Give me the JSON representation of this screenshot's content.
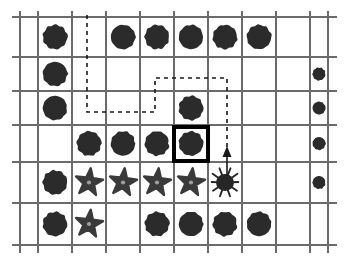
{
  "scene": {
    "title": "Grid world with obstacles, goal cell and agent path",
    "canvas": {
      "width": 345,
      "height": 261
    },
    "background_color": "#ffffff"
  },
  "grid": {
    "columns": 9,
    "rows": 6,
    "x_lines": [
      20,
      38,
      72,
      106,
      140,
      174,
      208,
      242,
      276,
      310,
      328
    ],
    "y_lines": [
      17,
      57,
      91,
      125,
      162,
      203,
      245
    ],
    "line_color": "#6b6b6b",
    "line_width": 2,
    "outer_stub_color": "#9a9a9a"
  },
  "legend": {
    "blob_label": "obstacle-blob",
    "star_label": "star-token",
    "bug_label": "agent-bug",
    "goal_label": "goal-cell",
    "path_label": "planned-path",
    "arrow_label": "move-arrow"
  },
  "colors": {
    "blob": "#2b2b2b",
    "star": "#3a3a3a",
    "star_center": "#9e9e9e",
    "bug": "#262626",
    "goal_border": "#000000",
    "path_dashed": "#1a1a1a",
    "path_solid": "#1a1a1a"
  },
  "cells": [
    {
      "row": 1,
      "col": 1,
      "type": "blob"
    },
    {
      "row": 1,
      "col": 3,
      "type": "blob"
    },
    {
      "row": 1,
      "col": 4,
      "type": "blob"
    },
    {
      "row": 1,
      "col": 5,
      "type": "blob"
    },
    {
      "row": 1,
      "col": 6,
      "type": "blob"
    },
    {
      "row": 1,
      "col": 7,
      "type": "blob"
    },
    {
      "row": 2,
      "col": 1,
      "type": "blob"
    },
    {
      "row": 2,
      "col": 9,
      "type": "blob"
    },
    {
      "row": 3,
      "col": 1,
      "type": "blob"
    },
    {
      "row": 3,
      "col": 5,
      "type": "blob"
    },
    {
      "row": 3,
      "col": 9,
      "type": "blob"
    },
    {
      "row": 4,
      "col": 2,
      "type": "blob"
    },
    {
      "row": 4,
      "col": 3,
      "type": "blob"
    },
    {
      "row": 4,
      "col": 4,
      "type": "blob"
    },
    {
      "row": 4,
      "col": 5,
      "type": "blob",
      "highlighted": true
    },
    {
      "row": 4,
      "col": 9,
      "type": "blob"
    },
    {
      "row": 5,
      "col": 1,
      "type": "blob"
    },
    {
      "row": 5,
      "col": 2,
      "type": "star"
    },
    {
      "row": 5,
      "col": 3,
      "type": "star"
    },
    {
      "row": 5,
      "col": 4,
      "type": "star"
    },
    {
      "row": 5,
      "col": 5,
      "type": "star"
    },
    {
      "row": 5,
      "col": 6,
      "type": "bug"
    },
    {
      "row": 5,
      "col": 9,
      "type": "blob"
    },
    {
      "row": 6,
      "col": 1,
      "type": "blob"
    },
    {
      "row": 6,
      "col": 2,
      "type": "star"
    },
    {
      "row": 6,
      "col": 4,
      "type": "blob"
    },
    {
      "row": 6,
      "col": 5,
      "type": "blob"
    },
    {
      "row": 6,
      "col": 6,
      "type": "blob"
    },
    {
      "row": 6,
      "col": 7,
      "type": "blob"
    }
  ],
  "highlight": {
    "x": 174,
    "y": 127,
    "width": 34,
    "height": 34,
    "stroke_width": 4
  },
  "path": {
    "dashed_points": "87,15 87,112 155,112 155,78 227,78 227,150",
    "dash_pattern": "4,4",
    "stroke_width": 1.6,
    "solid_points": "227,150 227,176",
    "arrow_head": {
      "x": 227,
      "y": 146,
      "half_width": 4.5,
      "height": 11
    }
  }
}
